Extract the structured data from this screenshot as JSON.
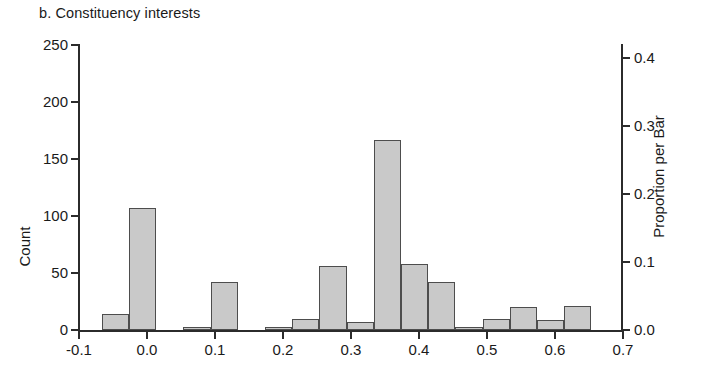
{
  "title": "b. Constituency interests",
  "axes": {
    "left_title": "Count",
    "right_title": "Proportion per Bar",
    "left_ticks": [
      "0",
      "50",
      "100",
      "150",
      "200",
      "250"
    ],
    "right_ticks": [
      "0.0",
      "0.1",
      "0.2",
      "0.3",
      "0.4"
    ],
    "x_ticks": [
      "-0.1",
      "0.0",
      "0.1",
      "0.2",
      "0.3",
      "0.4",
      "0.5",
      "0.6",
      "0.7"
    ]
  },
  "colors": {
    "bar_fill": "#c9c9c9",
    "bar_edge": "#4d4d4d",
    "axis": "#2b2b2b",
    "text": "#1a1a1a",
    "background": "#ffffff"
  },
  "chart_data": {
    "type": "bar",
    "title": "b. Constituency interests",
    "xlabel": "",
    "ylabel": "Count",
    "y2label": "Proportion per Bar",
    "xlim": [
      -0.1,
      0.7
    ],
    "ylim": [
      0,
      250
    ],
    "y2lim": [
      0.0,
      0.4
    ],
    "grid": false,
    "legend": "none",
    "bin_width": 0.04,
    "total_count": 572,
    "bin_left_edges": [
      -0.065,
      -0.025,
      0.015,
      0.055,
      0.095,
      0.135,
      0.175,
      0.215,
      0.255,
      0.295,
      0.335,
      0.375,
      0.415,
      0.455,
      0.495,
      0.535,
      0.575,
      0.615
    ],
    "categories": [
      "-0.065",
      "-0.025",
      "0.015",
      "0.055",
      "0.095",
      "0.135",
      "0.175",
      "0.215",
      "0.255",
      "0.295",
      "0.335",
      "0.375",
      "0.415",
      "0.455",
      "0.495",
      "0.535",
      "0.575",
      "0.615"
    ],
    "values": [
      14,
      107,
      0,
      3,
      42,
      0,
      3,
      10,
      56,
      7,
      167,
      58,
      42,
      3,
      10,
      20,
      9,
      21
    ],
    "proportion_values": [
      0.024,
      0.187,
      0.0,
      0.005,
      0.073,
      0.0,
      0.005,
      0.017,
      0.098,
      0.012,
      0.292,
      0.101,
      0.073,
      0.005,
      0.017,
      0.035,
      0.016,
      0.037
    ]
  }
}
